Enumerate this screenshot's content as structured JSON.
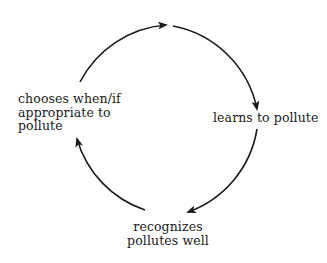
{
  "diagram": {
    "type": "cycle",
    "stroke_color": "#1a1a1a",
    "nodes": [
      {
        "id": "learns",
        "lines": [
          "learns to pollute"
        ]
      },
      {
        "id": "recognizes",
        "lines": [
          "recognizes",
          "pollutes well"
        ]
      },
      {
        "id": "chooses",
        "lines": [
          "chooses when/if",
          "appropriate to",
          "pollute"
        ]
      }
    ],
    "edges": [
      {
        "from": "chooses",
        "to": "learns",
        "segments": 2
      },
      {
        "from": "learns",
        "to": "recognizes"
      },
      {
        "from": "recognizes",
        "to": "chooses"
      }
    ]
  }
}
